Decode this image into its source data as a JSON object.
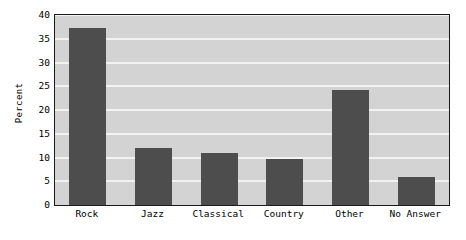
{
  "chart_data": {
    "type": "bar",
    "title": "",
    "subtitle": "",
    "xlabel": "",
    "ylabel": "Percent",
    "categories": [
      "Rock",
      "Jazz",
      "Classical",
      "Country",
      "Other",
      "No Answer"
    ],
    "values": [
      37.3,
      12.1,
      10.9,
      9.7,
      24.3,
      6.0
    ],
    "ylim": [
      0,
      40
    ],
    "ytick_values": [
      0,
      5,
      10,
      15,
      20,
      25,
      30,
      35,
      40
    ],
    "ytick_labels": [
      "0",
      "5",
      "10",
      "15",
      "20",
      "25",
      "30",
      "35",
      "40"
    ],
    "grid": "horizontal",
    "legend": "none",
    "colors": {
      "bar": "#4d4d4d",
      "plot_background": "#d3d3d3",
      "figure_background": "#ffffff",
      "gridline": "#f2f2f2",
      "axis_frame": "#1a1a1a",
      "text": "#000000"
    }
  }
}
